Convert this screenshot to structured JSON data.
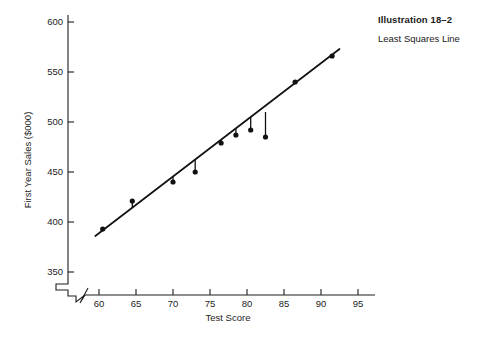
{
  "caption": {
    "title": "Illustration 18–2",
    "subtitle": "Least Squares Line"
  },
  "chart_data": {
    "type": "scatter",
    "title": "Illustration 18–2",
    "subtitle": "Least Squares Line",
    "xlabel": "Test Score",
    "ylabel": "First Year Sales ($000)",
    "xlim": [
      58,
      96
    ],
    "ylim": [
      340,
      605
    ],
    "xticks": [
      60,
      65,
      70,
      75,
      80,
      85,
      90,
      95
    ],
    "yticks": [
      350,
      400,
      450,
      500,
      550,
      600
    ],
    "grid": false,
    "legend": "none",
    "axis_break": {
      "y_axis": true,
      "x_axis": true,
      "note": "zigzag break below 350 on y-axis and left of 60 on x-axis"
    },
    "points": [
      {
        "x": 60.5,
        "y": 393
      },
      {
        "x": 64.5,
        "y": 421
      },
      {
        "x": 70.0,
        "y": 440
      },
      {
        "x": 73.0,
        "y": 450
      },
      {
        "x": 76.5,
        "y": 479
      },
      {
        "x": 78.5,
        "y": 487
      },
      {
        "x": 80.5,
        "y": 492
      },
      {
        "x": 82.5,
        "y": 485
      },
      {
        "x": 86.5,
        "y": 540
      },
      {
        "x": 91.5,
        "y": 566
      }
    ],
    "series": [
      {
        "name": "First Year Sales observations",
        "x": [
          60.5,
          64.5,
          70.0,
          73.0,
          76.5,
          78.5,
          80.5,
          82.5,
          86.5,
          91.5
        ],
        "values": [
          393,
          421,
          440,
          450,
          479,
          487,
          492,
          485,
          540,
          566
        ]
      }
    ],
    "fit_line": {
      "type": "line",
      "name": "Least squares line",
      "x": [
        59.5,
        92.5
      ],
      "y": [
        386,
        573
      ]
    },
    "residual_segments": [
      {
        "x": 82.5,
        "y_line": 510,
        "y_point": 485
      }
    ]
  }
}
